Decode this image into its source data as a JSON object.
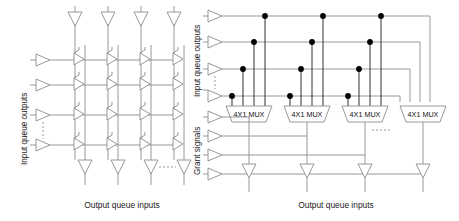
{
  "diagram": {
    "background_color": "#ffffff",
    "line_color": "#808080",
    "dot_color": "#000000",
    "text_color": "#1a1a1a",
    "left_panel": {
      "name": "crossbar-switch",
      "label_left": "Input queue outputs",
      "label_bottom": "Output queue inputs",
      "rows": 4,
      "columns": 4,
      "crosspoint_symbol": "buffer-triangle",
      "input_triangles": 4,
      "top_triangles": 4,
      "bottom_triangles": 4,
      "dashed_marks": [
        "vertical-row-ellipsis",
        "horizontal-column-ellipsis"
      ]
    },
    "right_panel": {
      "name": "mux-switch",
      "label_left_top": "Input queue outputs",
      "label_left_bottom": "Grant signals",
      "label_bottom": "Output queue inputs",
      "input_rows": 4,
      "grant_rows": 4,
      "mux_count": 4,
      "mux_labels": [
        "4X1 MUX",
        "4X1 MUX",
        "4X1 MUX",
        "4X1 MUX"
      ],
      "output_triangles": 4,
      "connection_dots": 16,
      "dashed_marks": [
        "vertical-row-ellipsis",
        "horizontal-mux-ellipsis"
      ]
    }
  }
}
